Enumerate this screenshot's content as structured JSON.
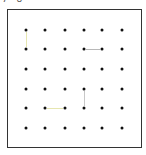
{
  "header": {
    "label": "7 8"
  },
  "board": {
    "rows": 6,
    "cols": 6,
    "dot_x": [
      26,
      45,
      65,
      84,
      102,
      122
    ],
    "dot_y": [
      30,
      49,
      69,
      89,
      108,
      128
    ],
    "border_color": "#333333",
    "dot_color": "#111111"
  },
  "edges": [
    {
      "type": "v",
      "from": [
        0,
        0
      ],
      "to": [
        1,
        0
      ],
      "color": "#e6e6b0"
    },
    {
      "type": "h",
      "from": [
        1,
        3
      ],
      "to": [
        1,
        4
      ],
      "color": "#b8b8b8"
    },
    {
      "type": "v",
      "from": [
        3,
        3
      ],
      "to": [
        4,
        3
      ],
      "color": "#c8c8c8"
    },
    {
      "type": "h",
      "from": [
        4,
        1
      ],
      "to": [
        4,
        2
      ],
      "color": "#e6e6b0"
    }
  ]
}
